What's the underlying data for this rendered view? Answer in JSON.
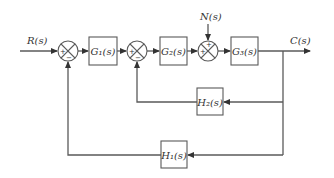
{
  "diagram": {
    "type": "control-system-block-diagram",
    "signals": {
      "input": "R(s)",
      "output": "C(s)",
      "disturbance": "N(s)"
    },
    "blocks": {
      "g1": "G₁(s)",
      "g2": "G₂(s)",
      "g3": "G₃(s)",
      "h1": "H₁(s)",
      "h2": "H₂(s)"
    },
    "summing_junctions": [
      {
        "id": "sum1",
        "signs": {
          "left": "+",
          "bottom": "−"
        }
      },
      {
        "id": "sum2",
        "signs": {
          "left": "+",
          "bottom": "−"
        }
      },
      {
        "id": "sum3",
        "signs": {
          "left": "+",
          "top": "+"
        }
      }
    ],
    "colors": {
      "line": "#5a5a5a",
      "text": "#333333",
      "background": "#ffffff"
    }
  }
}
